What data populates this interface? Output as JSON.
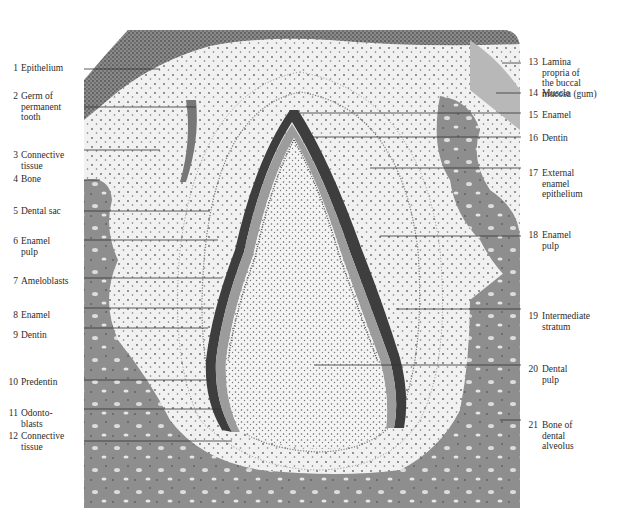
{
  "figure": {
    "type": "histology-illustration",
    "colors": {
      "paper": "#ffffff",
      "connective_light": "#efefef",
      "cell_dots": "#555555",
      "bone": "#8f8f8f",
      "epithelium": "#7a7a7a",
      "dentin": "#9a9a9a",
      "enamel": "#3a3a3a",
      "leader_line": "#333333"
    }
  },
  "labels_left": [
    {
      "num": "1",
      "text": "Epithelium",
      "y": 69,
      "line_y": 69,
      "line_to": 160
    },
    {
      "num": "2",
      "text": "Germ of\npermanent\ntooth",
      "y": 96,
      "line_y": 107,
      "line_to": 196
    },
    {
      "num": "3",
      "text": "Connective\ntissue",
      "y": 154,
      "line_y": 150,
      "line_to": 160
    },
    {
      "num": "4",
      "text": "Bone",
      "y": 177,
      "line_y": 180,
      "line_to": 100
    },
    {
      "num": "5",
      "text": "Dental sac",
      "y": 207,
      "line_y": 211,
      "line_to": 210
    },
    {
      "num": "6",
      "text": "Enamel\npulp",
      "y": 238,
      "line_y": 240,
      "line_to": 218
    },
    {
      "num": "7",
      "text": "Ameloblasts",
      "y": 277,
      "line_y": 278,
      "line_to": 222
    },
    {
      "num": "8",
      "text": "Enamel",
      "y": 311,
      "line_y": 308,
      "line_to": 214
    },
    {
      "num": "9",
      "text": "Dentin",
      "y": 331,
      "line_y": 328,
      "line_to": 208
    },
    {
      "num": "10",
      "text": "Predentin",
      "y": 378,
      "line_y": 380,
      "line_to": 210
    },
    {
      "num": "11",
      "text": "Odonto-\nblasts",
      "y": 409,
      "line_y": 409,
      "line_to": 220
    },
    {
      "num": "12",
      "text": "Connective\ntissue",
      "y": 431,
      "line_y": 441,
      "line_to": 232
    }
  ],
  "labels_right": [
    {
      "num": "13",
      "text": "Lamina\npropria of\nthe buccal\nmucosa (gum)",
      "y": 55,
      "line_y": 63,
      "line_from": 502
    },
    {
      "num": "14",
      "text": "Muscle",
      "y": 88,
      "line_y": 93,
      "line_from": 496
    },
    {
      "num": "15",
      "text": "Enamel",
      "y": 110,
      "line_y": 113,
      "line_from": 300
    },
    {
      "num": "16",
      "text": "Dentin",
      "y": 134,
      "line_y": 137,
      "line_from": 312
    },
    {
      "num": "17",
      "text": "External\nenamel\nepithelium",
      "y": 169,
      "line_y": 168,
      "line_from": 370
    },
    {
      "num": "18",
      "text": "Enamel\npulp",
      "y": 230,
      "line_y": 236,
      "line_from": 380
    },
    {
      "num": "19",
      "text": "Intermediate\nstratum",
      "y": 311,
      "line_y": 309,
      "line_from": 396
    },
    {
      "num": "20",
      "text": "Dental\npulp",
      "y": 364,
      "line_y": 365,
      "line_from": 314
    },
    {
      "num": "21",
      "text": "Bone of\ndental\nalveolus",
      "y": 420,
      "line_y": 420,
      "line_from": 500
    }
  ]
}
